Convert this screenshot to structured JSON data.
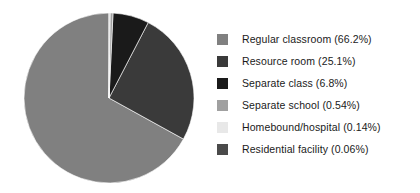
{
  "chart_data": {
    "type": "pie",
    "title": "",
    "subtitle": "",
    "xlabel": "",
    "ylabel": "",
    "grid": false,
    "legend_position": "right",
    "start_angle_deg": 0,
    "direction": "counterclockwise",
    "categories": [
      "Regular classroom",
      "Resource room",
      "Separate class",
      "Separate school",
      "Homebound/hospital",
      "Residential facility"
    ],
    "values": [
      66.2,
      25.1,
      6.8,
      0.54,
      0.14,
      0.06
    ],
    "value_unit": "%",
    "colors": [
      "#808080",
      "#3a3a3a",
      "#1a1a1a",
      "#a0a0a0",
      "#e8e8e8",
      "#4a4a4a"
    ],
    "labels": [
      "Regular classroom (66.2%)",
      "Resource room (25.1%)",
      "Separate class (6.8%)",
      "Separate school (0.54%)",
      "Homebound/hospital (0.14%)",
      "Residential facility (0.06%)"
    ]
  },
  "legend": {
    "items": [
      {
        "label": "Regular classroom (66.2%)",
        "color": "#808080",
        "name": "regular-classroom"
      },
      {
        "label": "Resource room (25.1%)",
        "color": "#3a3a3a",
        "name": "resource-room"
      },
      {
        "label": "Separate class (6.8%)",
        "color": "#1a1a1a",
        "name": "separate-class"
      },
      {
        "label": "Separate school (0.54%)",
        "color": "#a0a0a0",
        "name": "separate-school"
      },
      {
        "label": "Homebound/hospital (0.14%)",
        "color": "#e8e8e8",
        "name": "homebound-hospital"
      },
      {
        "label": "Residential facility (0.06%)",
        "color": "#4a4a4a",
        "name": "residential-facility"
      }
    ]
  },
  "pie": {
    "center_x": 109,
    "center_y": 98,
    "radius": 85
  }
}
